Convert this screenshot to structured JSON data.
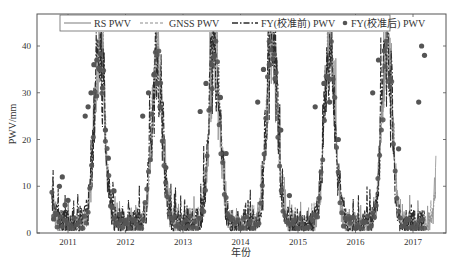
{
  "chart_data": {
    "type": "line",
    "title": "",
    "xlabel": "年份",
    "ylabel": "PWV/mm",
    "xlim": [
      2010.68,
      2017.8
    ],
    "ylim": [
      0,
      45
    ],
    "x_ticks": [
      2011,
      2012,
      2013,
      2014,
      2015,
      2016,
      2017
    ],
    "x_tick_labels": [
      "2011",
      "2012",
      "2013",
      "2014",
      "2015",
      "2016",
      "2017"
    ],
    "y_ticks": [
      0,
      10,
      20,
      30,
      40
    ],
    "y_tick_labels": [
      "0",
      "10",
      "20",
      "30",
      "40"
    ],
    "grid": false,
    "legend_position": "top, inside, horizontal",
    "series": [
      {
        "name": "RS PWV",
        "style": "solid",
        "color": "#9a9a9a",
        "x_range": [
          2010.72,
          2017.4
        ]
      },
      {
        "name": "GNSS PWV",
        "style": "dashed",
        "color": "#8c8c8c",
        "x_range": [
          2010.72,
          2017.4
        ]
      },
      {
        "name": "FY(校准前) PWV",
        "style": "dash-dot",
        "color": "#2b2b2b",
        "x_range": [
          2010.72,
          2017.2
        ]
      },
      {
        "name": "FY(校准后) PWV",
        "style": "markers",
        "color": "#555555",
        "x_range": [
          2010.72,
          2017.2
        ]
      }
    ],
    "seasonal_peaks": [
      {
        "year": 2011,
        "peak_x": 2011.55,
        "peak_pwv": 39
      },
      {
        "year": 2012,
        "peak_x": 2012.55,
        "peak_pwv": 37
      },
      {
        "year": 2013,
        "peak_x": 2013.55,
        "peak_pwv": 40
      },
      {
        "year": 2014,
        "peak_x": 2014.55,
        "peak_pwv": 42
      },
      {
        "year": 2015,
        "peak_x": 2015.55,
        "peak_pwv": 39
      },
      {
        "year": 2016,
        "peak_x": 2016.55,
        "peak_pwv": 39
      },
      {
        "year": 2017,
        "peak_x": 2017.55,
        "peak_pwv": 41
      }
    ],
    "winter_min_pwv": 2,
    "approx_marker_points": [
      [
        2010.75,
        3
      ],
      [
        2010.8,
        4
      ],
      [
        2010.85,
        10
      ],
      [
        2010.9,
        12
      ],
      [
        2010.95,
        6
      ],
      [
        2011.0,
        7
      ],
      [
        2011.3,
        25
      ],
      [
        2011.35,
        27
      ],
      [
        2011.4,
        30
      ],
      [
        2011.45,
        36
      ],
      [
        2011.5,
        37
      ],
      [
        2011.55,
        35
      ],
      [
        2011.6,
        31
      ],
      [
        2011.65,
        22
      ],
      [
        2011.7,
        16
      ],
      [
        2011.8,
        9
      ],
      [
        2011.9,
        4
      ],
      [
        2012.0,
        2
      ],
      [
        2012.3,
        25
      ],
      [
        2012.4,
        30
      ],
      [
        2012.5,
        34
      ],
      [
        2012.55,
        32
      ],
      [
        2012.6,
        27
      ],
      [
        2012.7,
        14
      ],
      [
        2013.3,
        26
      ],
      [
        2013.4,
        32
      ],
      [
        2013.5,
        36
      ],
      [
        2013.55,
        38
      ],
      [
        2013.65,
        29
      ],
      [
        2013.75,
        17
      ],
      [
        2014.3,
        28
      ],
      [
        2014.4,
        35
      ],
      [
        2014.5,
        36
      ],
      [
        2014.6,
        33
      ],
      [
        2014.7,
        22
      ],
      [
        2014.85,
        8
      ],
      [
        2015.3,
        27
      ],
      [
        2015.45,
        32
      ],
      [
        2015.55,
        28
      ],
      [
        2015.7,
        20
      ],
      [
        2015.9,
        3
      ],
      [
        2016.3,
        30
      ],
      [
        2016.4,
        37
      ],
      [
        2016.5,
        39
      ],
      [
        2016.6,
        33
      ],
      [
        2016.75,
        18
      ],
      [
        2016.9,
        3
      ],
      [
        2017.1,
        28
      ],
      [
        2017.15,
        40
      ],
      [
        2017.2,
        38
      ]
    ]
  }
}
